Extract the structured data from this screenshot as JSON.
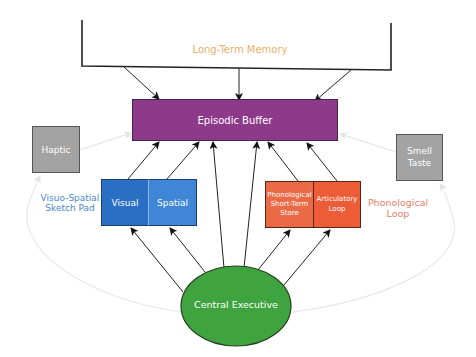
{
  "diagram": {
    "long_term_memory": {
      "label": "Long-Term Memory",
      "color": "#e8b06a"
    },
    "episodic_buffer": {
      "label": "Episodic Buffer",
      "color": "#8e3a8a"
    },
    "haptic": {
      "label": "Haptic",
      "color": "#a3a3a3"
    },
    "smell_taste": {
      "label_line1": "Smell",
      "label_line2": "Taste",
      "color": "#a3a3a3"
    },
    "visuo_spatial": {
      "label_line1": "Visuo-Spatial",
      "label_line2": "Sketch Pad",
      "label_color": "#4a86c8",
      "visual": {
        "label": "Visual",
        "color": "#2a6fc4"
      },
      "spatial": {
        "label": "Spatial",
        "color": "#3f86d6"
      }
    },
    "phonological": {
      "label_line1": "Phonological",
      "label_line2": "Loop",
      "label_color": "#e8806a",
      "store": {
        "label_line1": "Phonological",
        "label_line2": "Short-Term",
        "label_line3": "Store",
        "color": "#ea6a45"
      },
      "articulatory": {
        "label_line1": "Articulatory",
        "label_line2": "Loop",
        "color": "#ec5c36"
      }
    },
    "central_executive": {
      "label": "Central Executive",
      "color": "#3fa33f"
    }
  }
}
